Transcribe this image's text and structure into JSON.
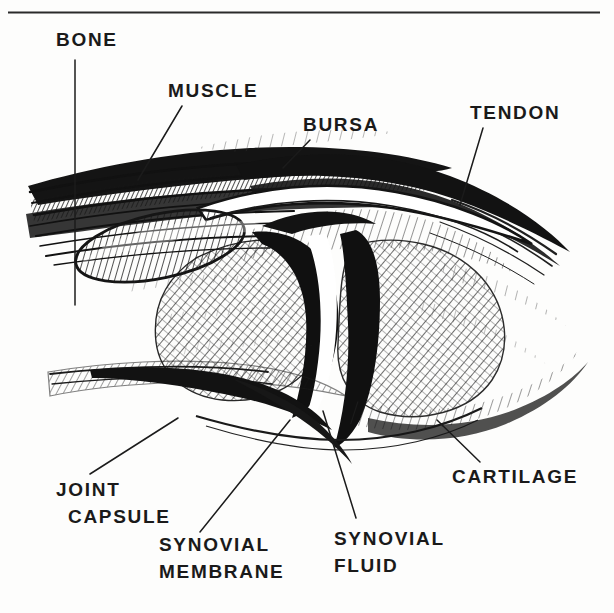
{
  "figure": {
    "style": "pen-and-ink cross-hatched medical illustration",
    "background_color": "#fdfdfc",
    "ink_color": "#1a1a1a",
    "frame": {
      "top_rule_visible": true,
      "top_rule_y": 12,
      "top_rule_x_start": 8,
      "top_rule_x_end": 600,
      "left_rule_visible": false,
      "right_rule_visible": false,
      "bottom_rule_visible": false
    },
    "clipped_header_text": "",
    "labels": [
      {
        "id": "bone",
        "text": "BONE",
        "lines": [
          "BONE"
        ],
        "text_x": 56,
        "text_y": 46,
        "anchor": "start",
        "leader": [
          [
            75,
            60
          ],
          [
            75,
            305
          ]
        ]
      },
      {
        "id": "muscle",
        "text": "MUSCLE",
        "lines": [
          "MUSCLE"
        ],
        "text_x": 168,
        "text_y": 97,
        "anchor": "start",
        "leader": [
          [
            182,
            106
          ],
          [
            138,
            180
          ]
        ]
      },
      {
        "id": "bursa",
        "text": "BURSA",
        "lines": [
          "BURSA"
        ],
        "text_x": 303,
        "text_y": 131,
        "anchor": "start",
        "leader": [
          [
            310,
            140
          ],
          [
            283,
            168
          ]
        ]
      },
      {
        "id": "tendon",
        "text": "TENDON",
        "lines": [
          "TENDON"
        ],
        "text_x": 470,
        "text_y": 119,
        "anchor": "start",
        "leader": [
          [
            483,
            128
          ],
          [
            460,
            205
          ]
        ]
      },
      {
        "id": "joint-capsule",
        "text": "JOINT CAPSULE",
        "lines": [
          "JOINT",
          "CAPSULE"
        ],
        "text_x": 56,
        "text_y": 496,
        "anchor": "start",
        "leader": [
          [
            90,
            474
          ],
          [
            178,
            418
          ]
        ]
      },
      {
        "id": "synovial-membrane",
        "text": "SYNOVIAL MEMBRANE",
        "lines": [
          "SYNOVIAL",
          "MEMBRANE"
        ],
        "text_x": 159,
        "text_y": 551,
        "anchor": "start",
        "leader": [
          [
            200,
            532
          ],
          [
            290,
            420
          ]
        ]
      },
      {
        "id": "synovial-fluid",
        "text": "SYNOVIAL FLUID",
        "lines": [
          "SYNOVIAL",
          "FLUID"
        ],
        "text_x": 334,
        "text_y": 545,
        "anchor": "start",
        "leader": [
          [
            356,
            518
          ],
          [
            323,
            411
          ]
        ]
      },
      {
        "id": "cartilage",
        "text": "CARTILAGE",
        "lines": [
          "CARTILAGE"
        ],
        "text_x": 452,
        "text_y": 483,
        "anchor": "start",
        "leader": [
          [
            480,
            462
          ],
          [
            437,
            420
          ]
        ]
      }
    ],
    "structures": [
      {
        "id": "muscle-belly",
        "name": "Muscle",
        "region": "upper-left",
        "shading": "dense diagonal hatch"
      },
      {
        "id": "bone-upper",
        "name": "Bone (upper / proximal)",
        "region": "left",
        "shading": "fine parallel hatch"
      },
      {
        "id": "bone-lower",
        "name": "Bone (lower / distal)",
        "region": "lower-left",
        "shading": "fine parallel hatch"
      },
      {
        "id": "bursa-sac",
        "name": "Bursa",
        "region": "upper-centre",
        "shading": "outlined fluid sac"
      },
      {
        "id": "tendon-band",
        "name": "Tendon",
        "region": "upper-right",
        "shading": "solid black band"
      },
      {
        "id": "cartilage-caps",
        "name": "Cartilage",
        "region": "centre",
        "shading": "solid black caps"
      },
      {
        "id": "joint-capsule-wedge",
        "name": "Joint capsule",
        "region": "lower-left",
        "shading": "solid black wedge"
      },
      {
        "id": "synovial-membrane-line",
        "name": "Synovial membrane",
        "region": "lower-centre",
        "shading": "thin outline"
      },
      {
        "id": "synovial-fluid-space",
        "name": "Synovial fluid",
        "region": "joint cavity",
        "shading": "white void"
      }
    ]
  }
}
